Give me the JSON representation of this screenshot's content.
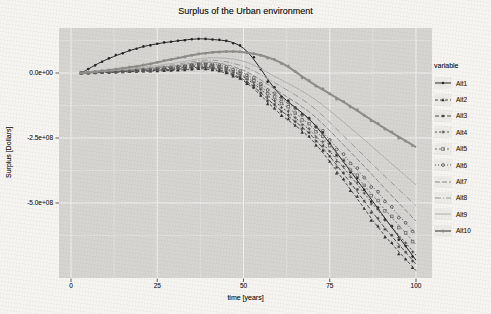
{
  "figure_title": "Surplus of the Urban environment",
  "colors": {
    "background": "#f6f5f2",
    "panel": "#d6d5d2",
    "grid_major": "#f1f0ed",
    "grid_minor": "#e4e3e0",
    "tick": "#3a3a3a",
    "text": "#2b2b2b"
  },
  "chart_data": {
    "type": "line",
    "title": "Surplus of the Urban environment",
    "xlabel": "time [years]",
    "ylabel": "Surplus [Dollars]",
    "legend_title": "variable",
    "legend_position": "right",
    "grid": true,
    "xlim": [
      -3.5,
      104.7
    ],
    "ylim": [
      -788000000,
      173000000
    ],
    "x_ticks": [
      0,
      25,
      50,
      75,
      100
    ],
    "x_tick_labels": [
      "0",
      "25",
      "50",
      "75",
      "100"
    ],
    "x_minor": [
      12.5,
      37.5,
      62.5,
      87.5
    ],
    "y_ticks": [
      0,
      -250000000,
      -500000000
    ],
    "y_tick_labels": [
      "0.0e+00",
      "-2.5e+08",
      "-5.0e+08"
    ],
    "y_minor": [
      125000000,
      -125000000,
      -375000000,
      -625000000
    ],
    "x": [
      3,
      10,
      20,
      30,
      40,
      50,
      60,
      70,
      80,
      90,
      100
    ],
    "series": [
      {
        "name": "Alt1",
        "color": "#262626",
        "dash": "",
        "width": 1,
        "marker": "circle",
        "values": [
          0,
          50000000,
          98000000,
          122000000,
          130000000,
          95000000,
          -75000000,
          -190000000,
          -360000000,
          -540000000,
          -720000000
        ]
      },
      {
        "name": "Alt2",
        "color": "#333333",
        "dash": "3 2",
        "width": 0.9,
        "marker": "triangle",
        "values": [
          0,
          2000000,
          6000000,
          10000000,
          14000000,
          -30000000,
          -150000000,
          -260000000,
          -430000000,
          -610000000,
          -760000000
        ]
      },
      {
        "name": "Alt3",
        "color": "#3d3d3d",
        "dash": "4 2",
        "width": 0.9,
        "marker": "asterisk",
        "values": [
          0,
          3000000,
          8000000,
          14000000,
          20000000,
          -25000000,
          -135000000,
          -245000000,
          -405000000,
          -580000000,
          -735000000
        ]
      },
      {
        "name": "Alt4",
        "color": "#454545",
        "dash": "2 2",
        "width": 0.9,
        "marker": "plus",
        "values": [
          0,
          3000000,
          9000000,
          17000000,
          25000000,
          -15000000,
          -120000000,
          -230000000,
          -380000000,
          -545000000,
          -700000000
        ]
      },
      {
        "name": "Alt5",
        "color": "#6e6e6e",
        "dash": "2 2",
        "width": 0.9,
        "marker": "square-open",
        "values": [
          0,
          4000000,
          11000000,
          20000000,
          30000000,
          -10000000,
          -105000000,
          -210000000,
          -355000000,
          -510000000,
          -660000000
        ]
      },
      {
        "name": "Alt6",
        "color": "#4f4f4f",
        "dash": "1 2",
        "width": 0.9,
        "marker": "circle-open",
        "values": [
          0,
          5000000,
          13000000,
          23000000,
          35000000,
          0,
          -90000000,
          -190000000,
          -330000000,
          -475000000,
          -620000000
        ]
      },
      {
        "name": "Alt7",
        "color": "#8b8b8b",
        "dash": "5 2",
        "width": 1,
        "marker": "none",
        "values": [
          0,
          6000000,
          15000000,
          27000000,
          42000000,
          10000000,
          -70000000,
          -160000000,
          -290000000,
          -430000000,
          -570000000
        ]
      },
      {
        "name": "Alt8",
        "color": "#9a9a9a",
        "dash": "6 2 1 2",
        "width": 1,
        "marker": "none",
        "values": [
          0,
          7000000,
          18000000,
          32000000,
          50000000,
          25000000,
          -45000000,
          -130000000,
          -255000000,
          -385000000,
          -510000000
        ]
      },
      {
        "name": "Alt9",
        "color": "#b3b1ae",
        "dash": "",
        "width": 1,
        "marker": "none",
        "values": [
          0,
          8000000,
          21000000,
          38000000,
          58000000,
          45000000,
          -20000000,
          -95000000,
          -200000000,
          -315000000,
          -430000000
        ]
      },
      {
        "name": "Alt10",
        "color": "#8f8d8a",
        "dash": "",
        "width": 2,
        "marker": "circle-small",
        "values": [
          0,
          10000000,
          28000000,
          55000000,
          78000000,
          80000000,
          45000000,
          -40000000,
          -120000000,
          -205000000,
          -285000000
        ]
      }
    ]
  }
}
